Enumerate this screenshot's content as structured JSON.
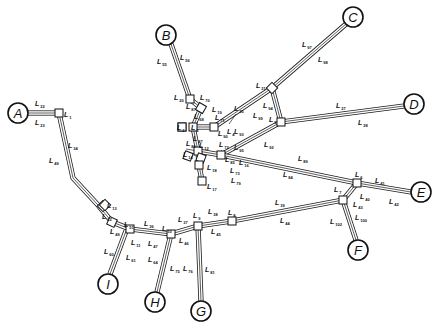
{
  "diagram": {
    "type": "network-topology",
    "width": 441,
    "height": 328,
    "terminals": [
      {
        "id": "A",
        "label": "A",
        "x": 18,
        "y": 113,
        "r": 10
      },
      {
        "id": "B",
        "label": "B",
        "x": 166,
        "y": 35,
        "r": 10
      },
      {
        "id": "C",
        "label": "C",
        "x": 353,
        "y": 17,
        "r": 10
      },
      {
        "id": "D",
        "label": "D",
        "x": 414,
        "y": 104,
        "r": 10
      },
      {
        "id": "E",
        "label": "E",
        "x": 421,
        "y": 192,
        "r": 10
      },
      {
        "id": "F",
        "label": "F",
        "x": 358,
        "y": 250,
        "r": 10
      },
      {
        "id": "G",
        "label": "G",
        "x": 201,
        "y": 311,
        "r": 10
      },
      {
        "id": "H",
        "label": "H",
        "x": 155,
        "y": 302,
        "r": 10
      },
      {
        "id": "I",
        "label": "I",
        "x": 108,
        "y": 284,
        "r": 10
      }
    ],
    "junctions": [
      {
        "id": "n1",
        "x": 59,
        "y": 113,
        "rot": 0
      },
      {
        "id": "n20",
        "x": 190,
        "y": 99,
        "rot": 0
      },
      {
        "id": "n19",
        "x": 201,
        "y": 108,
        "rot": 30
      },
      {
        "id": "n3",
        "x": 193,
        "y": 127,
        "rot": 0
      },
      {
        "id": "n2",
        "x": 182,
        "y": 127,
        "rot": 0
      },
      {
        "id": "n4",
        "x": 214,
        "y": 127,
        "rot": 0
      },
      {
        "id": "n21",
        "x": 272,
        "y": 88,
        "rot": 45
      },
      {
        "id": "n5",
        "x": 281,
        "y": 122,
        "rot": 0
      },
      {
        "id": "n12",
        "x": 198,
        "y": 151,
        "rot": 0
      },
      {
        "id": "n14",
        "x": 201,
        "y": 158,
        "rot": 20
      },
      {
        "id": "n18",
        "x": 199,
        "y": 165,
        "rot": 0
      },
      {
        "id": "n17",
        "x": 202,
        "y": 181,
        "rot": 0
      },
      {
        "id": "n16",
        "x": 221,
        "y": 155,
        "rot": 0
      },
      {
        "id": "n6",
        "x": 357,
        "y": 183,
        "rot": 0
      },
      {
        "id": "n7",
        "x": 343,
        "y": 200,
        "rot": 0
      },
      {
        "id": "n13",
        "x": 103,
        "y": 206,
        "rot": 45
      },
      {
        "id": "n11",
        "x": 112,
        "y": 222,
        "rot": 25
      },
      {
        "id": "n10",
        "x": 130,
        "y": 229,
        "rot": 0
      },
      {
        "id": "n9",
        "x": 171,
        "y": 234,
        "rot": 0
      },
      {
        "id": "n10b",
        "x": 198,
        "y": 226,
        "rot": 0
      },
      {
        "id": "n8",
        "x": 232,
        "y": 221,
        "rot": 0
      }
    ],
    "links": [
      {
        "id": "A-1",
        "points": [
          [
            28,
            113
          ],
          [
            59,
            113
          ]
        ],
        "labels": [
          "L22",
          "L23"
        ]
      },
      {
        "id": "1-11",
        "points": [
          [
            59,
            113
          ],
          [
            73,
            178
          ],
          [
            98,
            205
          ],
          [
            112,
            222
          ]
        ],
        "labels": [
          "L34",
          "L49"
        ]
      },
      {
        "id": "B-20",
        "points": [
          [
            171,
            44
          ],
          [
            190,
            99
          ]
        ],
        "labels": [
          "L55",
          "L56"
        ]
      },
      {
        "id": "20-19",
        "points": [
          [
            190,
            99
          ],
          [
            201,
            108
          ]
        ],
        "labels": [
          "L70",
          "L67"
        ]
      },
      {
        "id": "19-3",
        "points": [
          [
            201,
            108
          ],
          [
            193,
            127
          ]
        ],
        "labels": [
          "L19",
          "L68"
        ]
      },
      {
        "id": "3-4",
        "points": [
          [
            193,
            127
          ],
          [
            214,
            127
          ]
        ],
        "labels": [
          "L71",
          "L90"
        ]
      },
      {
        "id": "C-21",
        "points": [
          [
            346,
            24
          ],
          [
            272,
            88
          ]
        ],
        "labels": [
          "L97",
          "L98"
        ]
      },
      {
        "id": "21-5",
        "points": [
          [
            272,
            88
          ],
          [
            281,
            122
          ]
        ],
        "labels": [
          "L94"
        ]
      },
      {
        "id": "4-21",
        "points": [
          [
            214,
            127
          ],
          [
            272,
            88
          ]
        ],
        "labels": [
          "L25",
          "L99"
        ]
      },
      {
        "id": "D-5",
        "points": [
          [
            404,
            106
          ],
          [
            281,
            122
          ]
        ],
        "labels": [
          "L27",
          "L28"
        ]
      },
      {
        "id": "5-16",
        "points": [
          [
            281,
            122
          ],
          [
            221,
            155
          ]
        ],
        "labels": [
          "L95",
          "L92"
        ]
      },
      {
        "id": "3-12",
        "points": [
          [
            193,
            127
          ],
          [
            198,
            151
          ]
        ],
        "labels": [
          "L67"
        ]
      },
      {
        "id": "12-16",
        "points": [
          [
            198,
            151
          ],
          [
            221,
            155
          ]
        ],
        "labels": [
          "L72",
          "L85"
        ]
      },
      {
        "id": "12-18",
        "points": [
          [
            198,
            151
          ],
          [
            199,
            165
          ]
        ],
        "labels": [
          "L18"
        ]
      },
      {
        "id": "18-17",
        "points": [
          [
            199,
            165
          ],
          [
            202,
            181
          ]
        ],
        "labels": [
          "L73",
          "L79"
        ]
      },
      {
        "id": "16-6",
        "points": [
          [
            221,
            155
          ],
          [
            357,
            183
          ]
        ],
        "labels": [
          "L89",
          "L84"
        ]
      },
      {
        "id": "6-E",
        "points": [
          [
            357,
            183
          ],
          [
            411,
            192
          ]
        ],
        "labels": [
          "L41",
          "L42"
        ]
      },
      {
        "id": "6-7",
        "points": [
          [
            357,
            183
          ],
          [
            343,
            200
          ]
        ],
        "labels": [
          "L40",
          "L43"
        ]
      },
      {
        "id": "7-F",
        "points": [
          [
            343,
            200
          ],
          [
            356,
            240
          ]
        ],
        "labels": [
          "L100",
          "L102"
        ]
      },
      {
        "id": "7-8",
        "points": [
          [
            343,
            200
          ],
          [
            232,
            221
          ]
        ],
        "labels": [
          "L39",
          "L44"
        ]
      },
      {
        "id": "8-9",
        "points": [
          [
            232,
            221
          ],
          [
            198,
            226
          ]
        ],
        "labels": [
          "L38",
          "L45"
        ]
      },
      {
        "id": "9-10",
        "points": [
          [
            198,
            226
          ],
          [
            171,
            234
          ]
        ],
        "labels": [
          "L37",
          "L46"
        ]
      },
      {
        "id": "10-11",
        "points": [
          [
            171,
            234
          ],
          [
            130,
            229
          ],
          [
            112,
            222
          ]
        ],
        "labels": [
          "L36",
          "L47"
        ]
      },
      {
        "id": "11-I",
        "points": [
          [
            126,
            231
          ],
          [
            110,
            274
          ]
        ],
        "labels": [
          "L60",
          "L61"
        ]
      },
      {
        "id": "10-H",
        "points": [
          [
            171,
            234
          ],
          [
            157,
            292
          ]
        ],
        "labels": [
          "L64",
          "L75"
        ]
      },
      {
        "id": "9-G",
        "points": [
          [
            198,
            226
          ],
          [
            201,
            301
          ]
        ],
        "labels": [
          "L76",
          "L81"
        ]
      }
    ],
    "link_labels": [
      {
        "base": "L",
        "sub": "22",
        "x": 35,
        "y": 106
      },
      {
        "base": "L",
        "sub": "23",
        "x": 35,
        "y": 125
      },
      {
        "base": "L",
        "sub": "1",
        "x": 64,
        "y": 117
      },
      {
        "base": "L",
        "sub": "34",
        "x": 68,
        "y": 148
      },
      {
        "base": "L",
        "sub": "49",
        "x": 49,
        "y": 163
      },
      {
        "base": "L",
        "sub": "55",
        "x": 157,
        "y": 64
      },
      {
        "base": "L",
        "sub": "56",
        "x": 180,
        "y": 60
      },
      {
        "base": "L",
        "sub": "20",
        "x": 174,
        "y": 100
      },
      {
        "base": "L",
        "sub": "70",
        "x": 200,
        "y": 100
      },
      {
        "base": "L",
        "sub": "87",
        "x": 186,
        "y": 109
      },
      {
        "base": "L",
        "sub": "19",
        "x": 212,
        "y": 112
      },
      {
        "base": "L",
        "sub": "68",
        "x": 194,
        "y": 119
      },
      {
        "base": "L",
        "sub": "71",
        "x": 215,
        "y": 120
      },
      {
        "base": "L",
        "sub": "25",
        "x": 234,
        "y": 111
      },
      {
        "base": "L",
        "sub": "2",
        "x": 177,
        "y": 130
      },
      {
        "base": "L",
        "sub": "3",
        "x": 191,
        "y": 130
      },
      {
        "base": "L",
        "sub": "90",
        "x": 218,
        "y": 136
      },
      {
        "base": "L",
        "sub": "4",
        "x": 227,
        "y": 134
      },
      {
        "base": "L",
        "sub": "93",
        "x": 234,
        "y": 134
      },
      {
        "base": "L",
        "sub": "87",
        "x": 193,
        "y": 141
      },
      {
        "base": "L",
        "sub": "21",
        "x": 256,
        "y": 88
      },
      {
        "base": "L",
        "sub": "94",
        "x": 263,
        "y": 108
      },
      {
        "base": "L",
        "sub": "99",
        "x": 253,
        "y": 118
      },
      {
        "base": "L",
        "sub": "5",
        "x": 269,
        "y": 122
      },
      {
        "base": "L",
        "sub": "97",
        "x": 302,
        "y": 47
      },
      {
        "base": "L",
        "sub": "98",
        "x": 318,
        "y": 62
      },
      {
        "base": "L",
        "sub": "27",
        "x": 336,
        "y": 108
      },
      {
        "base": "L",
        "sub": "28",
        "x": 358,
        "y": 125
      },
      {
        "base": "L",
        "sub": "95",
        "x": 234,
        "y": 150
      },
      {
        "base": "L",
        "sub": "92",
        "x": 264,
        "y": 147
      },
      {
        "base": "L",
        "sub": "72",
        "x": 219,
        "y": 147
      },
      {
        "base": "L",
        "sub": "86",
        "x": 186,
        "y": 146
      },
      {
        "base": "L",
        "sub": "12",
        "x": 199,
        "y": 148
      },
      {
        "base": "L",
        "sub": "14",
        "x": 183,
        "y": 157
      },
      {
        "base": "L",
        "sub": "85",
        "x": 225,
        "y": 162
      },
      {
        "base": "L",
        "sub": "16",
        "x": 239,
        "y": 165
      },
      {
        "base": "L",
        "sub": "18",
        "x": 207,
        "y": 170
      },
      {
        "base": "L",
        "sub": "73",
        "x": 230,
        "y": 173
      },
      {
        "base": "L",
        "sub": "79",
        "x": 231,
        "y": 183
      },
      {
        "base": "L",
        "sub": "17",
        "x": 207,
        "y": 189
      },
      {
        "base": "L",
        "sub": "89",
        "x": 298,
        "y": 161
      },
      {
        "base": "L",
        "sub": "84",
        "x": 283,
        "y": 177
      },
      {
        "base": "L",
        "sub": "6",
        "x": 355,
        "y": 177
      },
      {
        "base": "L",
        "sub": "41",
        "x": 375,
        "y": 183
      },
      {
        "base": "L",
        "sub": "42",
        "x": 389,
        "y": 204
      },
      {
        "base": "L",
        "sub": "7",
        "x": 334,
        "y": 192
      },
      {
        "base": "L",
        "sub": "40",
        "x": 360,
        "y": 199
      },
      {
        "base": "L",
        "sub": "43",
        "x": 353,
        "y": 207
      },
      {
        "base": "L",
        "sub": "100",
        "x": 355,
        "y": 220
      },
      {
        "base": "L",
        "sub": "102",
        "x": 330,
        "y": 224
      },
      {
        "base": "L",
        "sub": "39",
        "x": 275,
        "y": 205
      },
      {
        "base": "L",
        "sub": "44",
        "x": 280,
        "y": 223
      },
      {
        "base": "L",
        "sub": "8",
        "x": 228,
        "y": 215
      },
      {
        "base": "L",
        "sub": "38",
        "x": 208,
        "y": 214
      },
      {
        "base": "L",
        "sub": "45",
        "x": 211,
        "y": 234
      },
      {
        "base": "L",
        "sub": "9",
        "x": 193,
        "y": 218
      },
      {
        "base": "L",
        "sub": "37",
        "x": 178,
        "y": 222
      },
      {
        "base": "L",
        "sub": "46",
        "x": 179,
        "y": 243
      },
      {
        "base": "L",
        "sub": "10",
        "x": 162,
        "y": 231
      },
      {
        "base": "L",
        "sub": "36",
        "x": 144,
        "y": 226
      },
      {
        "base": "L",
        "sub": "47",
        "x": 148,
        "y": 246
      },
      {
        "base": "L",
        "sub": "11",
        "x": 131,
        "y": 245
      },
      {
        "base": "L",
        "sub": "51",
        "x": 124,
        "y": 227
      },
      {
        "base": "L",
        "sub": "12",
        "x": 102,
        "y": 219
      },
      {
        "base": "L",
        "sub": "13",
        "x": 107,
        "y": 208
      },
      {
        "base": "L",
        "sub": "49",
        "x": 110,
        "y": 234
      },
      {
        "base": "L",
        "sub": "60",
        "x": 104,
        "y": 254
      },
      {
        "base": "L",
        "sub": "61",
        "x": 126,
        "y": 260
      },
      {
        "base": "L",
        "sub": "64",
        "x": 148,
        "y": 262
      },
      {
        "base": "L",
        "sub": "75",
        "x": 170,
        "y": 271
      },
      {
        "base": "L",
        "sub": "76",
        "x": 183,
        "y": 271
      },
      {
        "base": "L",
        "sub": "81",
        "x": 205,
        "y": 272
      }
    ],
    "isolated_nodes": [
      {
        "id": "n13iso",
        "label_base": "L",
        "label_sub": "13",
        "x": 105,
        "y": 205
      }
    ]
  }
}
